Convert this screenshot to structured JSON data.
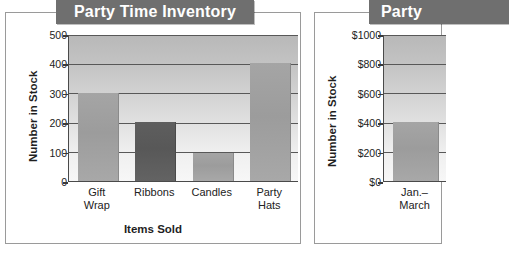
{
  "panels": [
    {
      "banner_title": "Party Time Inventory",
      "chart_data": {
        "type": "bar",
        "title": "Party Time Inventory",
        "xlabel": "Items Sold",
        "ylabel": "Number in Stock",
        "categories": [
          "Gift Wrap",
          "Ribbons",
          "Candles",
          "Party Hats"
        ],
        "values": [
          300,
          200,
          95,
          400
        ],
        "bar_colors": [
          "#a0a0a0",
          "#5b5b5b",
          "#a0a0a0",
          "#8f8f8f"
        ],
        "ylim": [
          0,
          500
        ],
        "yticks": [
          0,
          100,
          200,
          300,
          400,
          500
        ],
        "ytick_labels": [
          "0",
          "100",
          "200",
          "300",
          "400",
          "500"
        ],
        "grid": true,
        "legend": "none"
      }
    },
    {
      "banner_title": "Party",
      "chart_data": {
        "type": "bar",
        "title": "Party",
        "xlabel": "",
        "ylabel": "Number in Stock",
        "categories": [
          "Jan.–\nMarch"
        ],
        "category_lines": [
          [
            "Jan.–",
            "March"
          ]
        ],
        "values": [
          400
        ],
        "bar_colors": [
          "#9a9a9a"
        ],
        "ylim": [
          0,
          1000
        ],
        "yticks": [
          0,
          200,
          400,
          600,
          800,
          1000
        ],
        "ytick_labels": [
          "$0",
          "$200",
          "$400",
          "$600",
          "$800",
          "$1000"
        ],
        "grid": true,
        "legend": "none"
      }
    }
  ],
  "colors": {
    "banner_bg": "#6f6f6f",
    "banner_text": "#ffffff",
    "frame": "#9a9a9a",
    "axis": "#4a4a4a",
    "gridline": "#585858"
  }
}
